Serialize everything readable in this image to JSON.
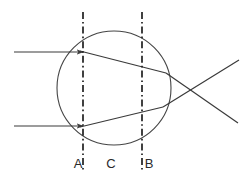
{
  "figure": {
    "kind": "optics-ray-diagram",
    "width": 246,
    "height": 183,
    "background_color": "#ffffff",
    "stroke_color": "#3a3a3a",
    "label_color": "#2a2a2a"
  },
  "lens": {
    "name": "circle",
    "center_x": 114,
    "center_y": 88,
    "radius": 57,
    "stroke_color": "#454545",
    "stroke_width": 1.1,
    "fill": "none"
  },
  "reference_lines": [
    {
      "id": "A",
      "label": "A",
      "x": 83,
      "y_top": 12,
      "y_bottom": 172,
      "style": "dash-dot",
      "stroke_color": "#202020",
      "stroke_width": 1.7,
      "label_x": 78,
      "label_y": 168
    },
    {
      "id": "B",
      "label": "B",
      "x": 142,
      "y_top": 12,
      "y_bottom": 172,
      "style": "dash-dot",
      "stroke_color": "#202020",
      "stroke_width": 1.7,
      "label_x": 149,
      "label_y": 168
    }
  ],
  "region_labels": [
    {
      "id": "C",
      "label": "C",
      "label_x": 111,
      "label_y": 168
    }
  ],
  "incident_rays": [
    {
      "id": "upper-incident-ray",
      "x1": 14,
      "y1": 52,
      "x2": 83,
      "y2": 52,
      "arrowhead": true,
      "stroke_color": "#3a3a3a",
      "stroke_width": 1.2
    },
    {
      "id": "lower-incident-ray",
      "x1": 14,
      "y1": 126,
      "x2": 83,
      "y2": 126,
      "arrowhead": true,
      "stroke_color": "#3a3a3a",
      "stroke_width": 1.2
    }
  ],
  "internal_rays": [
    {
      "id": "upper-internal-ray",
      "x1": 80,
      "y1": 51,
      "x2": 166,
      "y2": 73,
      "stroke_color": "#3a3a3a",
      "stroke_width": 1.2
    },
    {
      "id": "lower-internal-ray",
      "x1": 80,
      "y1": 127,
      "x2": 163,
      "y2": 107,
      "stroke_color": "#3a3a3a",
      "stroke_width": 1.2
    }
  ],
  "emergent_rays": [
    {
      "id": "upper-emergent-ray",
      "x1": 166,
      "y1": 73,
      "x2": 238,
      "y2": 123,
      "stroke_color": "#3a3a3a",
      "stroke_width": 1.2
    },
    {
      "id": "lower-emergent-ray",
      "x1": 163,
      "y1": 107,
      "x2": 239,
      "y2": 60,
      "stroke_color": "#3a3a3a",
      "stroke_width": 1.2
    }
  ],
  "focal_point": {
    "x": 199,
    "y": 89,
    "visible_marker": false
  }
}
